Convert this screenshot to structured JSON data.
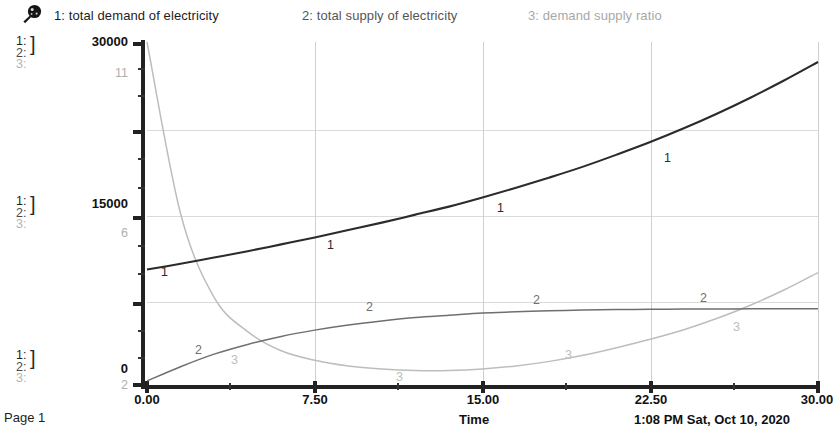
{
  "window": {
    "page_label": "Page 1"
  },
  "legend": {
    "icon": "pushpin-icon",
    "items": [
      {
        "num": "1:",
        "label": "1: total demand of  electricity",
        "color": "#1d1d1d"
      },
      {
        "num": "2:",
        "label": "2: total supply  of  electricity",
        "color": "#555555"
      },
      {
        "num": "3:",
        "label": "3: demand supply  ratio",
        "color": "#a8a8a8"
      }
    ]
  },
  "axis_stacks": [
    {
      "l1": "1:",
      "l2": "2:",
      "l3": "3:"
    },
    {
      "l1": "1:",
      "l2": "2:",
      "l3": "3:"
    },
    {
      "l1": "1:",
      "l2": "2:",
      "l3": "3:"
    }
  ],
  "chart_data": {
    "type": "line",
    "title": "",
    "xlabel": "Time",
    "ylabel": "",
    "grid": true,
    "legend_position": "top",
    "xlim": [
      0,
      30
    ],
    "xticks": [
      "0.00",
      "7.50",
      "15.00",
      "22.50",
      "30.00"
    ],
    "xtick_values": [
      0,
      7.5,
      15,
      22.5,
      30
    ],
    "y_axis_primary": {
      "label_series": [
        "1",
        "2"
      ],
      "ticks": [
        "0",
        "15000",
        "30000"
      ],
      "tick_values": [
        0,
        15000,
        30000
      ],
      "lim": [
        0,
        30000
      ]
    },
    "y_axis_secondary": {
      "label_series": [
        "3"
      ],
      "ticks": [
        "2",
        "6",
        "11"
      ],
      "tick_values": [
        2,
        6,
        11
      ],
      "lim": [
        2,
        11
      ]
    },
    "series": [
      {
        "name": "total demand of electricity",
        "marker": "1",
        "axis": "primary",
        "color": "#2b2b2b",
        "x": [
          0,
          1.5,
          3,
          4.5,
          6,
          7.5,
          9,
          10.5,
          12,
          13.5,
          15,
          16.5,
          18,
          19.5,
          21,
          22.5,
          24,
          25.5,
          27,
          28.5,
          30
        ],
        "values": [
          10100,
          10600,
          11150,
          11700,
          12300,
          12900,
          13550,
          14200,
          14900,
          15600,
          16400,
          17250,
          18150,
          19100,
          20150,
          21250,
          22450,
          23750,
          25150,
          26650,
          28250
        ]
      },
      {
        "name": "total supply of electricity",
        "marker": "2",
        "axis": "primary",
        "color": "#6f6f6f",
        "x": [
          0,
          1.5,
          3,
          4.5,
          6,
          7.5,
          9,
          10.5,
          12,
          13.5,
          15,
          16.5,
          18,
          19.5,
          21,
          22.5,
          24,
          25.5,
          27,
          28.5,
          30
        ],
        "values": [
          350,
          1600,
          2700,
          3550,
          4250,
          4800,
          5250,
          5600,
          5900,
          6100,
          6300,
          6400,
          6500,
          6550,
          6600,
          6620,
          6640,
          6650,
          6660,
          6670,
          6680
        ]
      },
      {
        "name": "demand supply ratio",
        "marker": "3",
        "axis": "secondary",
        "color": "#bdbdbd",
        "x": [
          0,
          1.5,
          3,
          4.5,
          6,
          7.5,
          9,
          10.5,
          12,
          13.5,
          15,
          16.5,
          18,
          19.5,
          21,
          22.5,
          24,
          25.5,
          27,
          28.5,
          30
        ],
        "values": [
          11.0,
          6.5,
          4.3,
          3.4,
          2.9,
          2.65,
          2.5,
          2.42,
          2.38,
          2.38,
          2.42,
          2.5,
          2.62,
          2.78,
          2.98,
          3.2,
          3.45,
          3.75,
          4.1,
          4.5,
          4.95
        ]
      }
    ]
  },
  "footer": {
    "time_label": "Time",
    "timestamp": "1:08 PM   Sat, Oct 10, 2020"
  }
}
